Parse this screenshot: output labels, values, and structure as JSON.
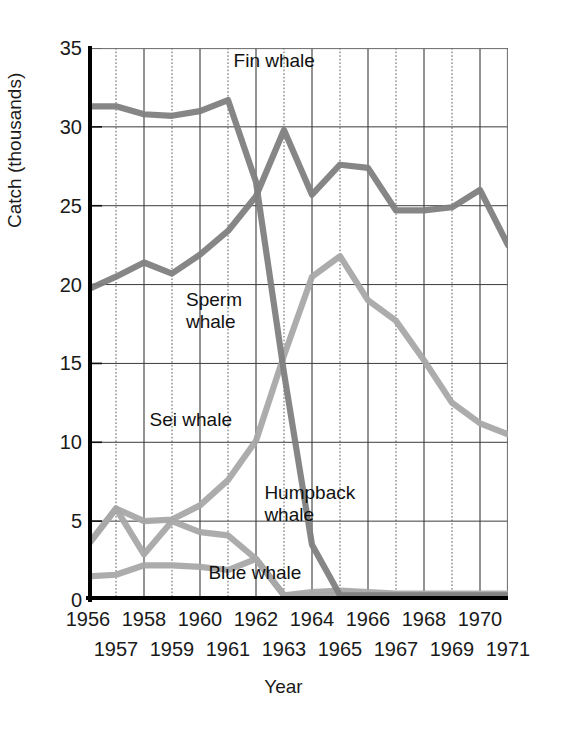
{
  "chart_data": {
    "type": "line",
    "title": "",
    "xlabel": "Year",
    "ylabel": "Catch (thousands)",
    "xlim": [
      1956,
      1971
    ],
    "ylim": [
      0,
      35
    ],
    "yticks": [
      0,
      5,
      10,
      15,
      20,
      25,
      30,
      35
    ],
    "xticks": [
      1956,
      1957,
      1958,
      1959,
      1960,
      1961,
      1962,
      1963,
      1964,
      1965,
      1966,
      1967,
      1968,
      1969,
      1970,
      1971
    ],
    "xtick_labels_row1": [
      "1956",
      "1958",
      "1960",
      "1962",
      "1964",
      "1966",
      "1968",
      "1970"
    ],
    "xtick_labels_row2": [
      "1957",
      "1959",
      "1961",
      "1963",
      "1965",
      "1967",
      "1969",
      "1971"
    ],
    "grid": true,
    "legend_position": "inline-annotations",
    "x": [
      1956,
      1957,
      1958,
      1959,
      1960,
      1961,
      1962,
      1963,
      1964,
      1965,
      1966,
      1967,
      1968,
      1969,
      1970,
      1971
    ],
    "series": [
      {
        "name": "Fin whale",
        "color": "#808080",
        "values": [
          31.3,
          31.3,
          30.8,
          30.7,
          31.0,
          31.7,
          26.5,
          14.4,
          3.5,
          0.3,
          0.3,
          0.3,
          0.3,
          0.3,
          0.3,
          0.3
        ]
      },
      {
        "name": "Sperm whale",
        "color": "#808080",
        "values": [
          19.7,
          20.5,
          21.4,
          20.7,
          21.9,
          23.4,
          25.6,
          29.8,
          25.7,
          27.6,
          27.4,
          24.7,
          24.7,
          24.9,
          26.0,
          22.5
        ]
      },
      {
        "name": "Sei whale",
        "color": "#a8a8a8",
        "values": [
          3.5,
          5.8,
          5.0,
          5.1,
          6.0,
          7.6,
          10.1,
          15.5,
          20.5,
          21.8,
          19.0,
          17.7,
          15.2,
          12.5,
          11.2,
          10.5
        ]
      },
      {
        "name": "Humpback whale",
        "color": "#a8a8a8",
        "values": [
          3.5,
          5.8,
          2.9,
          5.0,
          4.3,
          4.1,
          2.6,
          0.3,
          0.3,
          0.3,
          0.3,
          0.3,
          0.3,
          0.3,
          0.3,
          0.3
        ]
      },
      {
        "name": "Blue whale",
        "color": "#a8a8a8",
        "values": [
          1.5,
          1.6,
          2.2,
          2.2,
          2.1,
          1.9,
          2.6,
          0.3,
          0.5,
          0.6,
          0.5,
          0.4,
          0.4,
          0.4,
          0.4,
          0.4
        ]
      }
    ],
    "annotations": [
      {
        "text": "Fin whale",
        "x": 1961.2,
        "y": 34.0,
        "align": "left"
      },
      {
        "text": "Sperm\nwhale",
        "x": 1959.5,
        "y": 18.8,
        "align": "left"
      },
      {
        "text": "Sei whale",
        "x": 1958.2,
        "y": 11.2,
        "align": "left"
      },
      {
        "text": "Humpback\nwhale",
        "x": 1962.3,
        "y": 6.6,
        "align": "left"
      },
      {
        "text": "Blue whale",
        "x": 1960.3,
        "y": 1.5,
        "align": "left"
      }
    ]
  },
  "axis": {
    "ylabel": "Catch (thousands)",
    "xlabel": "Year"
  }
}
